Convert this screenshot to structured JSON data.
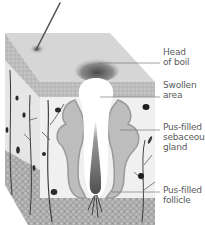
{
  "diagram": {
    "labels": [
      {
        "id": "head-of-boil",
        "text": "Head\nof boil",
        "top": 47,
        "leader_y": 63,
        "leader_x1": 98
      },
      {
        "id": "swollen-area",
        "text": "Swollen\narea",
        "top": 80,
        "leader_y": 97,
        "leader_x1": 100
      },
      {
        "id": "sebaceous-gland",
        "text": "Pus-filled\nsebaceous\ngland",
        "top": 122,
        "leader_y": 130,
        "leader_x1": 120
      },
      {
        "id": "follicle",
        "text": "Pus-filled\nfollicle",
        "top": 185,
        "leader_y": 192,
        "leader_x1": 112
      }
    ],
    "colors": {
      "top_surface": "#d6d6d6",
      "epidermis": "#bdbdbd",
      "dermis": "#ececec",
      "subcutaneous": "#a9a9a9",
      "side_face": "#cfcfcf",
      "gland": "#b8b8b8",
      "hair": "#555555",
      "leader_line": "#6a6a6a",
      "label_text": "#5a5a5a",
      "pus": "#ffffff"
    }
  }
}
